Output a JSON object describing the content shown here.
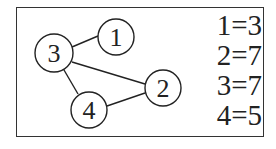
{
  "graph": {
    "nodes": [
      {
        "id": "1",
        "label": "1",
        "cx": 116,
        "cy": 37,
        "r": 18
      },
      {
        "id": "3",
        "label": "3",
        "cx": 54,
        "cy": 53,
        "r": 19
      },
      {
        "id": "2",
        "label": "2",
        "cx": 163,
        "cy": 88,
        "r": 18
      },
      {
        "id": "4",
        "label": "4",
        "cx": 89,
        "cy": 110,
        "r": 18
      }
    ],
    "edges": [
      {
        "from": "3",
        "to": "1"
      },
      {
        "from": "3",
        "to": "2"
      },
      {
        "from": "3",
        "to": "4"
      },
      {
        "from": "4",
        "to": "2"
      }
    ]
  },
  "legend": {
    "items": [
      "1=3",
      "2=7",
      "3=7",
      "4=5"
    ]
  },
  "colors": {
    "stroke": "#222222",
    "background": "#ffffff"
  }
}
